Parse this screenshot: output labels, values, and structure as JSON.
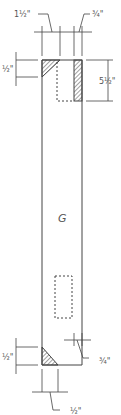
{
  "drawing": {
    "panel_label": "G",
    "dimensions": {
      "top_left_width": "1½\"",
      "top_right_width": "¾\"",
      "top_left_height": "½\"",
      "top_right_height": "5½\"",
      "bottom_right_width": "¾\"",
      "bottom_left_height": "½\"",
      "bottom_width": "½\""
    },
    "colors": {
      "line": "#444444",
      "text": "#555555",
      "background": "#ffffff"
    }
  }
}
